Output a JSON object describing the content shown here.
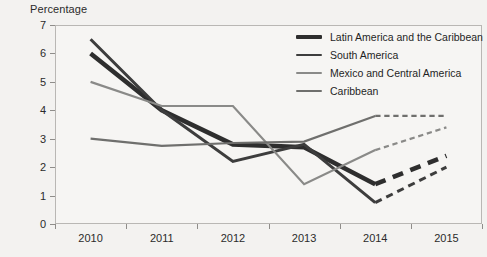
{
  "chart_data": {
    "type": "line",
    "title": "",
    "ylabel": "Percentage",
    "xlabel": "",
    "categories": [
      "2010",
      "2011",
      "2012",
      "2013",
      "2014",
      "2015"
    ],
    "ylim": [
      0,
      7
    ],
    "yticks": [
      "0",
      "1",
      "2",
      "3",
      "4",
      "5",
      "6",
      "7"
    ],
    "grid": false,
    "legend_position": "top-right",
    "note": "Segments from 2014 to 2015 are drawn dashed (projected values)",
    "series": [
      {
        "name": "Latin America and the Caribbean",
        "color": "#2e2e2e",
        "width": 4.6,
        "values": [
          6.0,
          4.0,
          2.8,
          2.7,
          1.4,
          2.4
        ],
        "dashed_from_index": 4
      },
      {
        "name": "South America",
        "color": "#3d3d3d",
        "width": 3.0,
        "values": [
          6.5,
          4.0,
          2.2,
          2.8,
          0.75,
          2.0
        ],
        "dashed_from_index": 4
      },
      {
        "name": "Mexico and Central America",
        "color": "#8a8a88",
        "width": 2.2,
        "values": [
          5.0,
          4.15,
          4.15,
          1.4,
          2.6,
          3.4
        ],
        "dashed_from_index": 4
      },
      {
        "name": "Caribbean",
        "color": "#6f6f6d",
        "width": 2.2,
        "values": [
          3.0,
          2.75,
          2.85,
          2.9,
          3.8,
          3.8
        ],
        "dashed_from_index": 4
      }
    ]
  }
}
